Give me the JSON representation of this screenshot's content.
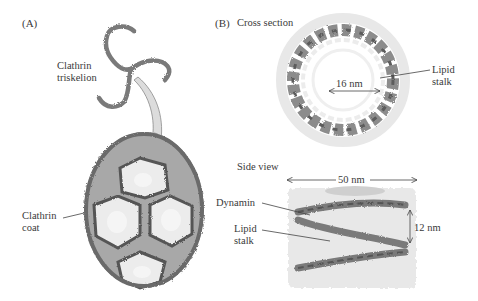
{
  "panel_a": {
    "tag": "(A)",
    "triskelion_label_line1": "Clathrin",
    "triskelion_label_line2": "triskelion",
    "coat_label_line1": "Clathrin",
    "coat_label_line2": "coat"
  },
  "panel_b": {
    "tag": "(B)",
    "cross_section_title": "Cross section",
    "inner_diameter": "16 nm",
    "lipid_stalk_label_line1": "Lipid",
    "lipid_stalk_label_line2": "stalk",
    "side_view_title": "Side view",
    "length": "50 nm",
    "dynamin_label": "Dynamin",
    "side_lipid_label_line1": "Lipid",
    "side_lipid_label_line2": "stalk",
    "height": "12 nm"
  },
  "colors": {
    "protein_gray": "#7d7d7d",
    "protein_dark": "#5a5a5a",
    "membrane_light": "#e3e3e3",
    "arrow_fill": "#dcdcdc"
  }
}
